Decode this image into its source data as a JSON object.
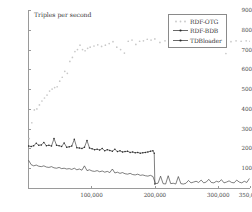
{
  "chart_data": {
    "type": "scatter",
    "title": "",
    "axis_note": "Triples per second",
    "xlabel": "",
    "ylabel": "Triples per second",
    "xlim": [
      0,
      350000
    ],
    "ylim": [
      0,
      900
    ],
    "grid": false,
    "legend_position": "top-right",
    "yticks": [
      100,
      200,
      300,
      400,
      500,
      600,
      700,
      800,
      900
    ],
    "ytick_labels": [
      "100",
      "200",
      "300",
      "400",
      "500",
      "600",
      "700",
      "800",
      "900"
    ],
    "xticks": [
      100000,
      200000,
      300000,
      350000
    ],
    "xtick_labels": [
      "100,000",
      "200,000",
      "300,000",
      "350,000"
    ],
    "series": [
      {
        "name": "RDF-OTG",
        "color": "#c8c8c8",
        "marker": "dot",
        "x": [
          2000,
          6000,
          10000,
          14000,
          18000,
          22000,
          26000,
          30000,
          34000,
          38000,
          42000,
          46000,
          50000,
          54000,
          58000,
          62000,
          66000,
          70000,
          74000,
          78000,
          82000,
          86000,
          90000,
          94000,
          98000,
          104000,
          110000,
          116000,
          122000,
          128000,
          134000,
          140000,
          146000,
          152000,
          158000,
          164000,
          170000,
          176000,
          182000,
          188000,
          194000,
          200000,
          208000,
          216000,
          224000,
          232000,
          240000,
          248000,
          256000,
          264000,
          272000,
          280000,
          288000,
          296000,
          304000,
          312000,
          320000,
          328000,
          336000,
          344000,
          350000
        ],
        "y": [
          250,
          330,
          395,
          400,
          420,
          440,
          455,
          470,
          490,
          500,
          508,
          512,
          540,
          560,
          590,
          580,
          640,
          660,
          690,
          700,
          722,
          700,
          694,
          706,
          712,
          718,
          724,
          716,
          722,
          730,
          740,
          712,
          700,
          682,
          742,
          748,
          726,
          742,
          744,
          752,
          748,
          754,
          736,
          744,
          752,
          756,
          758,
          752,
          760,
          762,
          756,
          764,
          758,
          752,
          748,
          680,
          740,
          744,
          742,
          744,
          742
        ]
      },
      {
        "name": "RDF-BDB",
        "color": "#2a2a2a",
        "marker": "dot-line",
        "x": [
          1000,
          5000,
          9000,
          13000,
          17000,
          21000,
          25000,
          29000,
          33000,
          37000,
          41000,
          45000,
          49000,
          53000,
          57000,
          61000,
          65000,
          69000,
          73000,
          77000,
          81000,
          85000,
          89000,
          93000,
          97000,
          101000,
          105000,
          109000,
          113000,
          117000,
          121000,
          125000,
          129000,
          133000,
          137000,
          141000,
          145000,
          149000,
          153000,
          157000,
          161000,
          165000,
          169000,
          173000,
          177000,
          181000,
          185000,
          189000,
          193000,
          197000,
          199000,
          200000
        ],
        "y": [
          212,
          210,
          214,
          226,
          216,
          218,
          230,
          214,
          216,
          212,
          250,
          216,
          214,
          210,
          228,
          206,
          208,
          212,
          246,
          204,
          202,
          200,
          206,
          240,
          202,
          198,
          194,
          196,
          192,
          200,
          188,
          194,
          190,
          186,
          196,
          184,
          188,
          182,
          184,
          186,
          180,
          182,
          178,
          180,
          176,
          178,
          180,
          182,
          186,
          188,
          176,
          20
        ]
      },
      {
        "name": "TDBloader",
        "color": "#2a2a2a",
        "marker": "line",
        "x": [
          1000,
          5000,
          9000,
          13000,
          17000,
          21000,
          25000,
          29000,
          33000,
          37000,
          41000,
          45000,
          49000,
          53000,
          57000,
          61000,
          65000,
          69000,
          73000,
          77000,
          81000,
          85000,
          89000,
          93000,
          97000,
          101000,
          105000,
          109000,
          113000,
          117000,
          121000,
          125000,
          129000,
          133000,
          137000,
          141000,
          145000,
          149000,
          153000,
          157000,
          161000,
          165000,
          169000,
          173000,
          177000,
          181000,
          185000,
          189000,
          193000,
          197000,
          201000,
          205000,
          209000,
          213000,
          217000,
          221000,
          225000,
          229000,
          233000,
          237000,
          241000,
          245000,
          249000,
          253000,
          257000,
          261000,
          265000,
          269000,
          273000,
          277000,
          281000,
          285000,
          289000,
          293000,
          297000,
          301000,
          305000,
          309000,
          313000,
          317000,
          321000,
          325000,
          329000,
          333000,
          337000,
          341000,
          345000,
          349000
        ],
        "y": [
          140,
          118,
          112,
          116,
          110,
          108,
          112,
          106,
          104,
          108,
          102,
          100,
          104,
          98,
          100,
          96,
          98,
          94,
          100,
          92,
          96,
          90,
          112,
          88,
          92,
          86,
          84,
          88,
          82,
          86,
          80,
          84,
          78,
          96,
          76,
          80,
          74,
          78,
          72,
          70,
          74,
          68,
          66,
          70,
          64,
          66,
          62,
          60,
          64,
          58,
          22,
          24,
          60,
          22,
          20,
          62,
          22,
          24,
          20,
          58,
          22,
          20,
          24,
          38,
          26,
          30,
          34,
          28,
          40,
          26,
          30,
          44,
          28,
          26,
          34,
          30,
          42,
          26,
          30,
          36,
          28,
          26,
          40,
          30,
          26,
          34,
          28,
          48
        ]
      }
    ]
  }
}
